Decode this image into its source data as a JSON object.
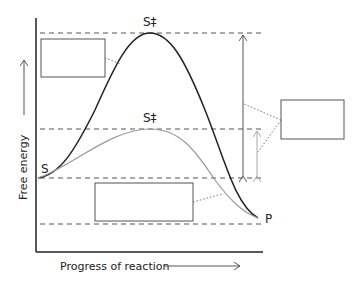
{
  "diagram": {
    "type": "reaction energy profile",
    "axes": {
      "y_label": "Free energy",
      "x_label": "Progress of reaction"
    },
    "labels": {
      "substrate": "S",
      "product": "P",
      "transition_state_uncatalyzed": "S‡",
      "transition_state_catalyzed": "S‡"
    },
    "curves": [
      {
        "name": "uncatalyzed",
        "color": "#222222",
        "peak_label": "S‡"
      },
      {
        "name": "catalyzed",
        "color": "#999999",
        "peak_label": "S‡"
      }
    ],
    "blank_label_boxes": [
      {
        "name": "box-upper-left",
        "text": ""
      },
      {
        "name": "box-bottom",
        "text": ""
      },
      {
        "name": "box-right",
        "text": ""
      }
    ],
    "colors": {
      "line_dark": "#222222",
      "line_gray": "#999999",
      "dashed": "#555555"
    }
  }
}
